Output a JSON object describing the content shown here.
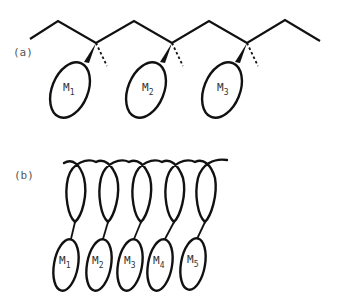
{
  "figure": {
    "panel_a": {
      "label": "(a)",
      "description": "Zig-zag polymer backbone with pendant groups",
      "groups": [
        {
          "letter": "M",
          "sub": "1"
        },
        {
          "letter": "M",
          "sub": "2"
        },
        {
          "letter": "M",
          "sub": "3"
        }
      ]
    },
    "panel_b": {
      "label": "(b)",
      "description": "Helical polymer backbone with pendant groups",
      "groups": [
        {
          "letter": "M",
          "sub": "1"
        },
        {
          "letter": "M",
          "sub": "2"
        },
        {
          "letter": "M",
          "sub": "3"
        },
        {
          "letter": "M",
          "sub": "4"
        },
        {
          "letter": "M",
          "sub": "5"
        }
      ]
    },
    "colors": {
      "line": "#111111",
      "label": "#555555",
      "background": "#ffffff"
    }
  }
}
